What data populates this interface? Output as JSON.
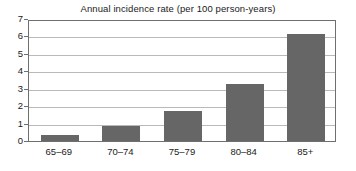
{
  "chart_data": {
    "type": "bar",
    "title": "Annual incidence rate (per 100 person-years)",
    "xlabel": "",
    "ylabel": "",
    "categories": [
      "65–69",
      "70–74",
      "75–79",
      "80–84",
      "85+"
    ],
    "values": [
      0.35,
      0.85,
      1.7,
      3.25,
      6.15
    ],
    "series": [
      {
        "name": "Annual incidence rate",
        "values": [
          0.35,
          0.85,
          1.7,
          3.25,
          6.15
        ]
      }
    ],
    "ylim": [
      0,
      7
    ],
    "ytick_labels": [
      "0",
      "1",
      "2",
      "3",
      "4",
      "5",
      "6",
      "7"
    ],
    "ytick_values": [
      0,
      1,
      2,
      3,
      4,
      5,
      6,
      7
    ],
    "grid": true,
    "grid_axis": "y",
    "legend": false,
    "legend_position": "none",
    "bar_color": "#666666",
    "gridline_color": "#b9b9b9",
    "axis_color": "#6f6f6f",
    "background_color": "#ffffff"
  }
}
